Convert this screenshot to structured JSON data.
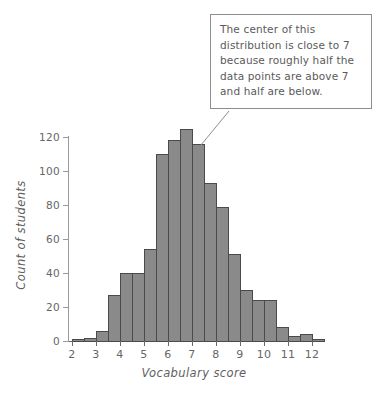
{
  "figure": {
    "background_color": "#ffffff",
    "bar_fill_color": "#8a8a8a",
    "bar_edge_color": "#4a4a4a",
    "axis_color": "#6a6a6a",
    "text_color": "#5a5a5a"
  },
  "callout": {
    "text": "The center of this distribution is close to 7 because roughly half the data points are above 7 and half are below.",
    "border_color": "#8d8d8d",
    "points_at_x": 7
  },
  "chart_data": {
    "type": "bar",
    "title": "",
    "subtitle": "",
    "xlabel": "Vocabulary score",
    "ylabel": "Count of students",
    "xlim": [
      1.75,
      12.75
    ],
    "ylim": [
      0,
      128
    ],
    "grid": false,
    "legend": null,
    "bin_width": 0.5,
    "xticks": [
      2,
      3,
      4,
      5,
      6,
      7,
      8,
      9,
      10,
      11,
      12
    ],
    "xtick_labels": [
      "2",
      "3",
      "4",
      "5",
      "6",
      "7",
      "8",
      "9",
      "10",
      "11",
      "12"
    ],
    "yticks": [
      0,
      20,
      40,
      60,
      80,
      100,
      120
    ],
    "ytick_labels": [
      "0",
      "20",
      "40",
      "60",
      "80",
      "100",
      "120"
    ],
    "bins": [
      {
        "start": 2.0,
        "end": 2.5,
        "value": 1
      },
      {
        "start": 2.5,
        "end": 3.0,
        "value": 2
      },
      {
        "start": 3.0,
        "end": 3.5,
        "value": 6
      },
      {
        "start": 3.5,
        "end": 4.0,
        "value": 27
      },
      {
        "start": 4.0,
        "end": 4.5,
        "value": 40
      },
      {
        "start": 4.5,
        "end": 5.0,
        "value": 40
      },
      {
        "start": 5.0,
        "end": 5.5,
        "value": 54
      },
      {
        "start": 5.5,
        "end": 6.0,
        "value": 110
      },
      {
        "start": 6.0,
        "end": 6.5,
        "value": 118
      },
      {
        "start": 6.5,
        "end": 7.0,
        "value": 125
      },
      {
        "start": 7.0,
        "end": 7.5,
        "value": 116
      },
      {
        "start": 7.5,
        "end": 8.0,
        "value": 93
      },
      {
        "start": 8.0,
        "end": 8.5,
        "value": 79
      },
      {
        "start": 8.5,
        "end": 9.0,
        "value": 51
      },
      {
        "start": 9.0,
        "end": 9.5,
        "value": 30
      },
      {
        "start": 9.5,
        "end": 10.0,
        "value": 24
      },
      {
        "start": 10.0,
        "end": 10.5,
        "value": 24
      },
      {
        "start": 10.5,
        "end": 11.0,
        "value": 8
      },
      {
        "start": 11.0,
        "end": 11.5,
        "value": 3
      },
      {
        "start": 11.5,
        "end": 12.0,
        "value": 4
      },
      {
        "start": 12.0,
        "end": 12.5,
        "value": 1
      }
    ],
    "categories": [
      "2.0",
      "2.5",
      "3.0",
      "3.5",
      "4.0",
      "4.5",
      "5.0",
      "5.5",
      "6.0",
      "6.5",
      "7.0",
      "7.5",
      "8.0",
      "8.5",
      "9.0",
      "9.5",
      "10.0",
      "10.5",
      "11.0",
      "11.5",
      "12.0"
    ],
    "values": [
      1,
      2,
      6,
      27,
      40,
      40,
      54,
      110,
      118,
      125,
      116,
      93,
      79,
      51,
      30,
      24,
      24,
      8,
      3,
      4,
      1
    ]
  }
}
